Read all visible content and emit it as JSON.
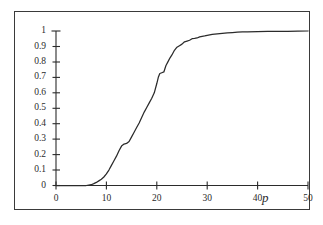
{
  "figure": {
    "background_color": "#ffffff",
    "frame_color": "#3a3a3a",
    "curve_color": "#2b2b2b"
  },
  "chart_data": {
    "type": "line",
    "title": "",
    "subtitle": "",
    "xlabel": "p",
    "ylabel": "",
    "xlim": [
      0,
      50
    ],
    "ylim": [
      0,
      1
    ],
    "grid": false,
    "legend": null,
    "x_ticks": [
      0,
      10,
      20,
      30,
      40,
      50
    ],
    "x_tick_labels": [
      "0",
      "10",
      "20",
      "30",
      "40",
      "50"
    ],
    "y_ticks": [
      0,
      0.1,
      0.2,
      0.3,
      0.4,
      0.5,
      0.6,
      0.7,
      0.8,
      0.9,
      1
    ],
    "y_tick_labels": [
      "0",
      "0.1",
      "0.2",
      "0.3",
      "0.4",
      "0.5",
      "0.6",
      "0.7",
      "0.8",
      "0.9",
      "1"
    ],
    "annotations": [],
    "series": [
      {
        "name": "cumulative distribution",
        "x": [
          0,
          1,
          2,
          3,
          4,
          5,
          6,
          7,
          7.5,
          8,
          8.5,
          9,
          9.5,
          10,
          10.5,
          11,
          11.5,
          12,
          12.5,
          13,
          13.5,
          14,
          14.5,
          15,
          15.5,
          16,
          16.5,
          17,
          17.5,
          18,
          18.5,
          19,
          19.5,
          20,
          20.3,
          20.6,
          21,
          21.4,
          21.8,
          22.2,
          22.6,
          23,
          23.5,
          24,
          24.5,
          25,
          25.5,
          26,
          26.5,
          27,
          27.5,
          28,
          28.5,
          29,
          29.5,
          30,
          31,
          32,
          33,
          34,
          35,
          36,
          37,
          38,
          40,
          42,
          44,
          46,
          48,
          50
        ],
        "y": [
          0,
          0,
          0,
          0,
          0,
          0,
          0,
          0.005,
          0.012,
          0.02,
          0.03,
          0.04,
          0.055,
          0.075,
          0.1,
          0.13,
          0.16,
          0.19,
          0.225,
          0.255,
          0.268,
          0.272,
          0.285,
          0.315,
          0.345,
          0.375,
          0.405,
          0.44,
          0.475,
          0.505,
          0.535,
          0.565,
          0.6,
          0.66,
          0.7,
          0.725,
          0.73,
          0.735,
          0.775,
          0.8,
          0.825,
          0.845,
          0.875,
          0.895,
          0.905,
          0.915,
          0.93,
          0.935,
          0.94,
          0.95,
          0.952,
          0.955,
          0.962,
          0.965,
          0.968,
          0.972,
          0.978,
          0.982,
          0.985,
          0.988,
          0.99,
          0.992,
          0.994,
          0.995,
          0.996,
          0.997,
          0.998,
          0.998,
          0.999,
          1.0
        ]
      }
    ]
  }
}
